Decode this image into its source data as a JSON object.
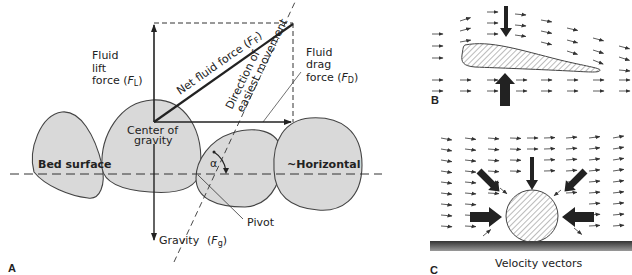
{
  "panels": {
    "a": {
      "label": "A",
      "lift": {
        "l1": "Fluid",
        "l2": "lift",
        "l3": "force (",
        "sym": "F",
        "sub": "L",
        "close": ")"
      },
      "net": {
        "text": "Net fluid force (",
        "sym": "F",
        "sub": "F",
        "close": ")"
      },
      "direction": {
        "l1": "Direction of",
        "l2": "easiest movement"
      },
      "drag": {
        "l1": "Fluid",
        "l2": "drag",
        "l3": "force (",
        "sym": "F",
        "sub": "D",
        "close": ")"
      },
      "cog": {
        "l1": "Center of",
        "l2": "gravity"
      },
      "bed": "Bed surface",
      "horizontal": "~Horizontal",
      "alpha": "α",
      "pivot": "Pivot",
      "gravity": {
        "text": "Gravity",
        "open": "(",
        "sym": "F",
        "sub": "g",
        "close": ")"
      }
    },
    "b": {
      "label": "B"
    },
    "c": {
      "label": "C",
      "caption": "Velocity vectors"
    }
  },
  "colors": {
    "grain": "#d9d9d9",
    "ink": "#222222",
    "bed": "#3a3a3a"
  }
}
